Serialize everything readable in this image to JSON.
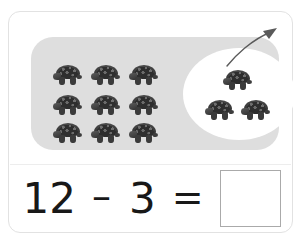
{
  "worksheet": {
    "type": "subtraction-picture-problem",
    "object_icon": "tortoise-icon",
    "arrow_icon": "curved-arrow-icon",
    "colors": {
      "card_background": "#ffffff",
      "card_border": "#e2e2e2",
      "group_panel": "#dedede",
      "subtracted_ellipse": "#ffffff",
      "equation_text": "#181818",
      "answer_box_border": "#aaaaaa",
      "arrow": "#5a5a5a"
    },
    "picture": {
      "total_count": 12,
      "remaining_group": {
        "label": "remaining-tortoises",
        "count": 9,
        "rows": 3,
        "columns": 3,
        "items": [
          {
            "name": "tortoise-1",
            "x": 22,
            "y": 28
          },
          {
            "name": "tortoise-2",
            "x": 60,
            "y": 28
          },
          {
            "name": "tortoise-3",
            "x": 98,
            "y": 28
          },
          {
            "name": "tortoise-4",
            "x": 22,
            "y": 58
          },
          {
            "name": "tortoise-5",
            "x": 60,
            "y": 58
          },
          {
            "name": "tortoise-6",
            "x": 98,
            "y": 58
          },
          {
            "name": "tortoise-7",
            "x": 22,
            "y": 86
          },
          {
            "name": "tortoise-8",
            "x": 60,
            "y": 86
          },
          {
            "name": "tortoise-9",
            "x": 98,
            "y": 86
          }
        ]
      },
      "subtracted_group": {
        "label": "tortoises-taken-away",
        "count": 3,
        "items": [
          {
            "name": "tortoise-10",
            "x": 40,
            "y": 22
          },
          {
            "name": "tortoise-11",
            "x": 22,
            "y": 52
          },
          {
            "name": "tortoise-12",
            "x": 58,
            "y": 52
          }
        ]
      }
    },
    "equation": {
      "minuend": "12",
      "operator": "–",
      "subtrahend": "3",
      "equals": "=",
      "answer_value": "",
      "answer_placeholder": ""
    }
  }
}
